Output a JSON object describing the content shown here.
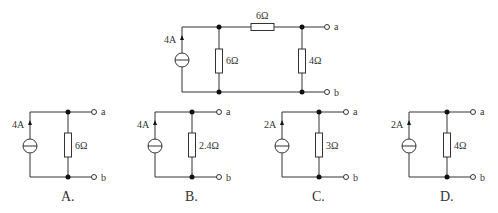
{
  "main_circuit": {
    "source_label": "4A",
    "r_shunt_label": "6Ω",
    "r_series_label": "6Ω",
    "r_load_label": "4Ω",
    "terminal_a": "a",
    "terminal_b": "b"
  },
  "options": [
    {
      "letter": "A.",
      "source_label": "4A",
      "resistor_label": "6Ω",
      "terminal_a": "a",
      "terminal_b": "b"
    },
    {
      "letter": "B.",
      "source_label": "4A",
      "resistor_label": "2.4Ω",
      "terminal_a": "a",
      "terminal_b": "b"
    },
    {
      "letter": "C.",
      "source_label": "2A",
      "resistor_label": "3Ω",
      "terminal_a": "a",
      "terminal_b": "b"
    },
    {
      "letter": "D.",
      "source_label": "2A",
      "resistor_label": "4Ω",
      "terminal_a": "a",
      "terminal_b": "b"
    }
  ]
}
